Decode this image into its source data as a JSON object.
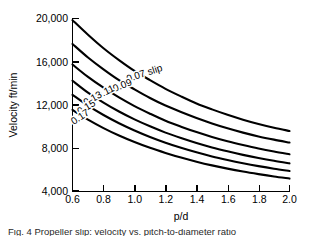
{
  "chart_data": {
    "type": "line",
    "title": "",
    "xlabel": "p/d",
    "ylabel": "Velocity ft/min",
    "xlim": [
      0.6,
      2.0
    ],
    "ylim": [
      4000,
      20000
    ],
    "xticks": [
      "0.6",
      "0.8",
      "1.0",
      "1.2",
      "1.4",
      "1.6",
      "1.8",
      "2.0"
    ],
    "xtick_values": [
      0.6,
      0.8,
      1.0,
      1.2,
      1.4,
      1.6,
      1.8,
      2.0
    ],
    "yticks": [
      "4,000",
      "8,000",
      "12,000",
      "16,000",
      "20,000"
    ],
    "ytick_values": [
      4000,
      8000,
      12000,
      16000,
      20000
    ],
    "grid": false,
    "legend": "inline-curve-labels",
    "x": [
      0.6,
      0.7,
      0.8,
      0.9,
      1.0,
      1.1,
      1.2,
      1.3,
      1.4,
      1.5,
      1.6,
      1.7,
      1.8,
      1.9,
      2.0
    ],
    "series": [
      {
        "name": "0.07 slip",
        "label": "0.07 slip",
        "slip": 0.07,
        "values": [
          19800,
          18450,
          17200,
          16100,
          15100,
          14250,
          13450,
          12750,
          12100,
          11550,
          11050,
          10600,
          10200,
          9850,
          9550
        ]
      },
      {
        "name": "0.09",
        "label": "0.09",
        "slip": 0.09,
        "values": [
          17600,
          16350,
          15250,
          14250,
          13400,
          12600,
          11900,
          11300,
          10750,
          10250,
          9800,
          9400,
          9050,
          8750,
          8480
        ]
      },
      {
        "name": "0.11",
        "label": "0.11",
        "slip": 0.11,
        "values": [
          15700,
          14550,
          13550,
          12650,
          11850,
          11150,
          10500,
          9950,
          9450,
          9000,
          8600,
          8250,
          7930,
          7650,
          7400
        ]
      },
      {
        "name": "0.13",
        "label": "0.13",
        "slip": 0.13,
        "values": [
          14200,
          13100,
          12180,
          11350,
          10620,
          9980,
          9400,
          8900,
          8440,
          8030,
          7670,
          7340,
          7050,
          6790,
          6560
        ]
      },
      {
        "name": "0.15",
        "label": "0.15",
        "slip": 0.15,
        "values": [
          12900,
          11900,
          11030,
          10270,
          9600,
          9000,
          8470,
          8000,
          7580,
          7200,
          6870,
          6570,
          6300,
          6060,
          5850
        ]
      },
      {
        "name": "0.17",
        "label": "0.17",
        "slip": 0.17,
        "values": [
          11500,
          10600,
          9820,
          9130,
          8530,
          7990,
          7520,
          7090,
          6710,
          6370,
          6070,
          5800,
          5560,
          5340,
          5150
        ]
      }
    ],
    "annotations": [
      {
        "text": "0.07 slip",
        "x": 1.07,
        "y": 14600,
        "rotation": -18
      },
      {
        "text": "0.09",
        "x": 0.93,
        "y": 13500,
        "rotation": -22
      },
      {
        "text": "0.11",
        "x": 0.82,
        "y": 12900,
        "rotation": -26
      },
      {
        "text": "0.13",
        "x": 0.74,
        "y": 12300,
        "rotation": -29
      },
      {
        "text": "0.15",
        "x": 0.7,
        "y": 11500,
        "rotation": -31
      },
      {
        "text": "0.17",
        "x": 0.66,
        "y": 10600,
        "rotation": -33
      }
    ]
  },
  "figure": {
    "caption": "Fig. 4  Propeller slip: velocity vs. pitch-to-diameter ratio"
  }
}
